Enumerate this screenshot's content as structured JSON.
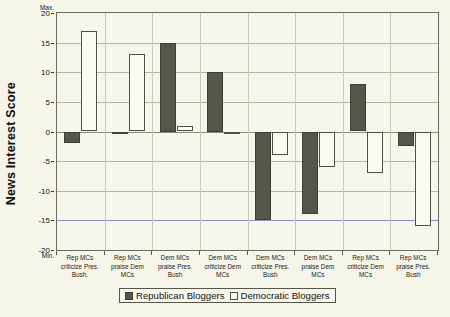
{
  "chart_data": {
    "type": "bar",
    "title": "",
    "xlabel": "",
    "ylabel": "News Interest Score",
    "ylim": [
      -20,
      20
    ],
    "ytick_values": [
      20,
      15,
      10,
      5,
      0,
      -5,
      -10,
      -15,
      -20
    ],
    "ytick_labels": [
      "20",
      "15",
      "10",
      "5",
      "0",
      "-5",
      "-10",
      "-15",
      "-20"
    ],
    "axis_max_caption": "Max.",
    "axis_min_caption": "Min.",
    "grid": true,
    "legend_position": "bottom",
    "categories": [
      "Rep MCs criticize Pres. Bush.",
      "Rep MCs praise Dem MCs",
      "Dem MCs praise Pres. Bush",
      "Dem MCs criticize Dem MCs",
      "Dem MCs criticize Pres. Bush",
      "Dem MCs praise Dem MCs",
      "Rep MCs criticize Dem MCs",
      "Rep MCs praise Pres. Bush"
    ],
    "category_lines": [
      [
        "Rep MCs",
        "criticize Pres.",
        "Bush."
      ],
      [
        "Rep MCs",
        "praise Dem",
        "MCs"
      ],
      [
        "Dem MCs",
        "praise Pres.",
        "Bush"
      ],
      [
        "Dem MCs",
        "criticize Dem",
        "MCs"
      ],
      [
        "Dem MCs",
        "criticize Pres.",
        "Bush"
      ],
      [
        "Dem MCs",
        "praise Dem",
        "MCs"
      ],
      [
        "Rep MCs",
        "criticize Dem",
        "MCs"
      ],
      [
        "Rep MCs",
        "praise Pres.",
        "Bush"
      ]
    ],
    "series": [
      {
        "name": "Republican Bloggers",
        "color": "#57564a",
        "values": [
          -2,
          0,
          15,
          10,
          -15,
          -14,
          8,
          -2.5
        ]
      },
      {
        "name": "Democratic Bloggers",
        "color": "#fbfaf1",
        "values": [
          17,
          13,
          1,
          0,
          -4,
          -6,
          -7,
          -16
        ]
      }
    ]
  },
  "legend": {
    "items": [
      {
        "label": "Republican Bloggers",
        "style": "rep"
      },
      {
        "label": "Democratic Bloggers",
        "style": "dem"
      }
    ]
  }
}
